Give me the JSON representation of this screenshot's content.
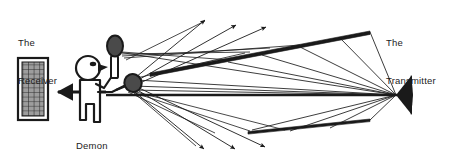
{
  "figure": {
    "background_color": "#ffffff",
    "ink_color": "#1a1a1a",
    "width": 460,
    "height": 167
  },
  "labels": {
    "receiver": "The\nReceiver",
    "receiver_line1": "The",
    "receiver_line2": "Receiver",
    "transmitter": "The\nTransmitter",
    "transmitter_line1": "The",
    "transmitter_line2": "Transmitter",
    "demon": "Demon"
  },
  "elements": {
    "receiver_panel": {
      "name": "receiver-panel",
      "description": "vertical rectangular grid/mesh panel at far left",
      "x": 18,
      "y": 58,
      "width": 30,
      "height": 62,
      "grid_columns": 5,
      "grid_rows": 13,
      "fill": "#a8a8a8",
      "border_color": "#1a1a1a"
    },
    "receiver_arrow": {
      "name": "receiver-input-arrow",
      "description": "thick arrow pointing left into the receiver panel",
      "from_x": 108,
      "from_y": 92,
      "to_x": 52,
      "to_y": 92
    },
    "demon_figure": {
      "name": "demon-stick-figure",
      "description": "stick figure with round head holding two rackets",
      "head_cx": 88,
      "head_cy": 68,
      "head_r": 12
    },
    "racket_upper": {
      "name": "racket-upper",
      "description": "dark oval racket head held up high, scatter point",
      "cx": 115,
      "cy": 48,
      "rx": 8,
      "ry": 10
    },
    "racket_lower": {
      "name": "racket-lower",
      "description": "dark oval racket head held low-right, scatter point",
      "cx": 133,
      "cy": 84,
      "rx": 8.5,
      "ry": 9
    },
    "transmitter_horn": {
      "name": "transmitter-horn",
      "description": "solid black triangular horn pointing left",
      "tip_x": 396,
      "tip_y": 95,
      "back_x": 412,
      "top_y": 76,
      "bottom_y": 114
    },
    "reflector_upper": {
      "name": "reflector-bar-upper",
      "description": "thin elongated reflector bar slanting up to the right",
      "x1": 150,
      "y1": 72,
      "x2": 370,
      "y2": 32
    },
    "reflector_lower": {
      "name": "reflector-bar-lower",
      "description": "thin elongated reflector bar slanting down to the left",
      "x1": 248,
      "y1": 130,
      "x2": 370,
      "y2": 120
    },
    "axis_line": {
      "name": "main-axis-line",
      "description": "thick horizontal line from demon to transmitter tip",
      "x1": 108,
      "y1": 95,
      "x2": 396,
      "y2": 95
    },
    "arrows_up": {
      "name": "scattered-rays-up",
      "count": 3,
      "tips": [
        [
          207,
          17
        ],
        [
          238,
          22
        ],
        [
          268,
          24
        ]
      ]
    },
    "arrows_down": {
      "name": "scattered-rays-down",
      "count": 3,
      "tips": [
        [
          207,
          152
        ],
        [
          238,
          152
        ],
        [
          268,
          150
        ]
      ]
    }
  }
}
